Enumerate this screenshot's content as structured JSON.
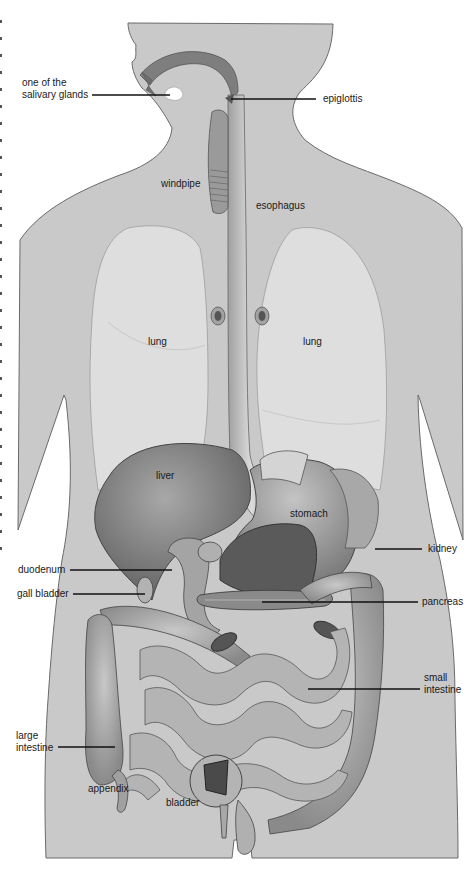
{
  "diagram": {
    "type": "anatomical-illustration",
    "colors": {
      "body": "#c9c9c9",
      "body_outline": "#6a6a6a",
      "lung": "#dedede",
      "organ_dark": "#7a7a7a",
      "organ_mid": "#9c9c9c",
      "organ_light": "#bdbdbd",
      "text": "#1a1a1a",
      "background": "#ffffff"
    },
    "labels": {
      "salivary": {
        "line1": "one of the",
        "line2": "salivary glands"
      },
      "epiglottis": "epiglottis",
      "windpipe": "windpipe",
      "esophagus": "esophagus",
      "lung_left": "lung",
      "lung_right": "lung",
      "liver": "liver",
      "stomach": "stomach",
      "kidney": "kidney",
      "duodenum": "duodenum",
      "gall_bladder": "gall bladder",
      "pancreas": "pancreas",
      "small_intestine": {
        "line1": "small",
        "line2": "intestine"
      },
      "large_intestine": {
        "line1": "large",
        "line2": "intestine"
      },
      "appendix": "appendix",
      "bladder": "bladder"
    }
  }
}
